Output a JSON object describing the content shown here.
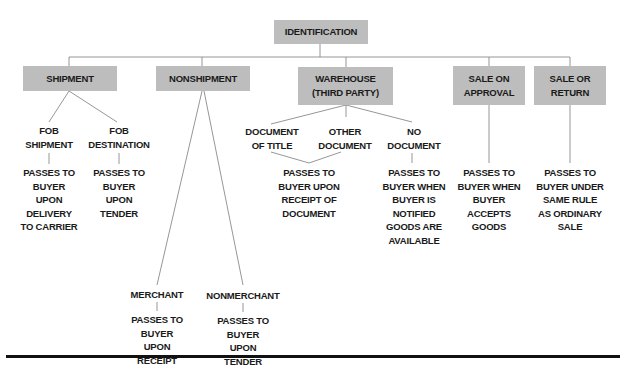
{
  "root": {
    "label": "IDENTIFICATION"
  },
  "categories": [
    {
      "id": "shipment",
      "label_lines": [
        "SHIPMENT"
      ]
    },
    {
      "id": "nonshipment",
      "label_lines": [
        "NONSHIPMENT"
      ]
    },
    {
      "id": "warehouse",
      "label_lines": [
        "WAREHOUSE",
        "(THIRD PARTY)"
      ]
    },
    {
      "id": "sale-on-approval",
      "label_lines": [
        "SALE ON",
        "APPROVAL"
      ]
    },
    {
      "id": "sale-or-return",
      "label_lines": [
        "SALE OR",
        "RETURN"
      ]
    }
  ],
  "shipment": {
    "fob_shipment": {
      "label_lines": [
        "FOB",
        "SHIPMENT"
      ],
      "outcome_lines": [
        "PASSES TO",
        "BUYER",
        "UPON",
        "DELIVERY",
        "TO CARRIER"
      ]
    },
    "fob_destination": {
      "label_lines": [
        "FOB",
        "DESTINATION"
      ],
      "outcome_lines": [
        "PASSES TO",
        "BUYER",
        "UPON",
        "TENDER"
      ]
    }
  },
  "nonshipment": {
    "merchant": {
      "label": "MERCHANT",
      "outcome_lines": [
        "PASSES TO",
        "BUYER",
        "UPON",
        "RECEIPT"
      ]
    },
    "nonmerchant": {
      "label": "NONMERCHANT",
      "outcome_lines": [
        "PASSES TO",
        "BUYER",
        "UPON",
        "TENDER"
      ]
    }
  },
  "warehouse": {
    "document_of_title": {
      "label_lines": [
        "DOCUMENT",
        "OF TITLE"
      ]
    },
    "other_document": {
      "label_lines": [
        "OTHER",
        "DOCUMENT"
      ]
    },
    "shared_outcome_lines": [
      "PASSES TO",
      "BUYER UPON",
      "RECEIPT OF",
      "DOCUMENT"
    ],
    "no_document": {
      "label_lines": [
        "NO",
        "DOCUMENT"
      ],
      "outcome_lines": [
        "PASSES TO",
        "BUYER WHEN",
        "BUYER IS",
        "NOTIFIED",
        "GOODS ARE",
        "AVAILABLE"
      ]
    }
  },
  "sale_on_approval": {
    "outcome_lines": [
      "PASSES TO",
      "BUYER WHEN",
      "BUYER",
      "ACCEPTS",
      "GOODS"
    ]
  },
  "sale_or_return": {
    "outcome_lines": [
      "PASSES TO",
      "BUYER UNDER",
      "SAME RULE",
      "AS ORDINARY",
      "SALE"
    ]
  },
  "colors": {
    "box_fill": "#bdbdbd",
    "line": "#8a8a8a",
    "text": "#1a1a1a",
    "rule": "#111111"
  }
}
